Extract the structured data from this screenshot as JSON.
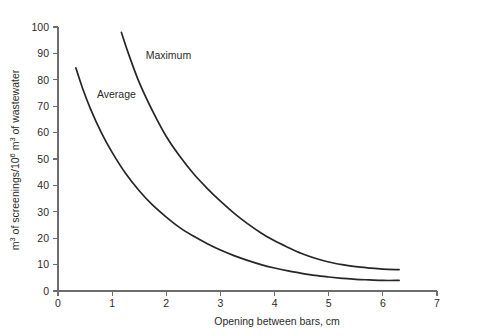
{
  "chart_data": {
    "type": "line",
    "title": "",
    "xlabel": "Opening between bars, cm",
    "ylabel": "m³ of screenings/10⁶ m³ of wastewater",
    "ylabel_parts": {
      "p1": "m",
      "sup1": "3",
      "p2": " of screenings/10",
      "sup2": "6",
      "p3": " m",
      "sup3": "3",
      "p4": " of wastewater"
    },
    "xlim": [
      0,
      7
    ],
    "ylim": [
      0,
      100
    ],
    "xticks": [
      0,
      1,
      2,
      3,
      4,
      5,
      6,
      7
    ],
    "xtick_labels": [
      "0",
      "1",
      "2",
      "3",
      "4",
      "5",
      "6",
      "7"
    ],
    "yticks": [
      0,
      10,
      20,
      30,
      40,
      50,
      60,
      70,
      80,
      90,
      100
    ],
    "ytick_labels": [
      "0",
      "10",
      "20",
      "30",
      "40",
      "50",
      "60",
      "70",
      "80",
      "90",
      "100"
    ],
    "grid": false,
    "legend_position": "inline-annotation",
    "series": [
      {
        "name": "Maximum",
        "label": "Maximum",
        "color": "#262626",
        "label_x": 1.62,
        "label_y": 88,
        "x": [
          1.17,
          1.3,
          1.5,
          1.75,
          2.0,
          2.25,
          2.5,
          2.75,
          3.0,
          3.25,
          3.5,
          3.75,
          4.0,
          4.25,
          4.5,
          4.75,
          5.0,
          5.25,
          5.5,
          5.75,
          6.0,
          6.3
        ],
        "y": [
          98,
          90,
          79,
          68,
          58.5,
          51,
          44.5,
          39,
          34,
          29.5,
          25.5,
          22,
          19,
          16.5,
          14.2,
          12.4,
          11.0,
          10.0,
          9.2,
          8.7,
          8.3,
          8.1
        ]
      },
      {
        "name": "Average",
        "label": "Average",
        "color": "#262626",
        "label_x": 0.72,
        "label_y": 73,
        "x": [
          0.33,
          0.45,
          0.6,
          0.8,
          1.0,
          1.25,
          1.5,
          1.75,
          2.0,
          2.25,
          2.5,
          2.75,
          3.0,
          3.25,
          3.5,
          3.75,
          4.0,
          4.25,
          4.5,
          4.75,
          5.0,
          5.25,
          5.5,
          5.75,
          6.0,
          6.3
        ],
        "y": [
          84.5,
          77,
          69,
          60,
          52.5,
          44.5,
          38,
          32.5,
          28,
          24,
          20.8,
          18.0,
          15.5,
          13.4,
          11.6,
          10.0,
          8.7,
          7.6,
          6.7,
          5.9,
          5.3,
          4.8,
          4.4,
          4.2,
          4.0,
          4.0
        ]
      }
    ]
  }
}
